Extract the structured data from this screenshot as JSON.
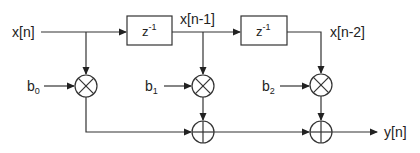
{
  "diagram": {
    "type": "FIR filter signal-flow graph",
    "input_label": "x[n]",
    "output_label": "y[n]",
    "delays": [
      {
        "label_base": "z",
        "label_sup": "-1",
        "output_label": "x[n-1]"
      },
      {
        "label_base": "z",
        "label_sup": "-1",
        "output_label": "x[n-2]"
      }
    ],
    "coefficients": [
      {
        "base": "b",
        "sub": "0"
      },
      {
        "base": "b",
        "sub": "1"
      },
      {
        "base": "b",
        "sub": "2"
      }
    ],
    "multiplier_symbol": "⊗",
    "adder_symbol": "⊕"
  }
}
